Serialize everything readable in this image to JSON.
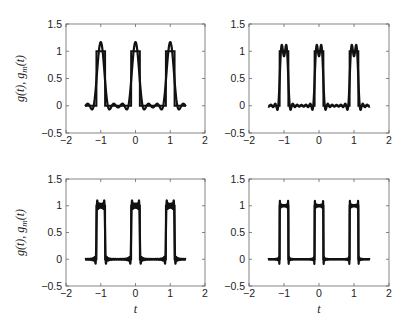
{
  "chart_data": [
    {
      "type": "line",
      "panel": "top-left",
      "title": "",
      "xlabel": "",
      "ylabel": "g(t), g_m(t)",
      "xlim": [
        -2,
        2
      ],
      "ylim": [
        -0.5,
        1.5
      ],
      "xticks": [
        -2,
        -1,
        0,
        1,
        2
      ],
      "yticks": [
        -0.5,
        0,
        0.5,
        1,
        1.5
      ],
      "xtick_labels": [
        "−2",
        "−1",
        "0",
        "1",
        "2"
      ],
      "ytick_labels": [
        "−0.5",
        "0",
        "0.5",
        "1",
        "1.5"
      ],
      "grid": false,
      "legend": null,
      "series": [
        {
          "name": "g(t)",
          "description": "periodic rectangular pulse train, period 1, pulse width 0.25 centered at integers, range t in [-1.5, 1.5]",
          "period": 1,
          "pulse_width": 0.25,
          "low": 0,
          "high": 1
        },
        {
          "name": "g_m(t)",
          "description": "Fourier partial sum approximation, few harmonics",
          "harmonics": 3
        }
      ]
    },
    {
      "type": "line",
      "panel": "top-right",
      "title": "",
      "xlabel": "",
      "ylabel": "",
      "xlim": [
        -2,
        2
      ],
      "ylim": [
        -0.5,
        1.5
      ],
      "xticks": [
        -2,
        -1,
        0,
        1,
        2
      ],
      "yticks": [
        -0.5,
        0,
        0.5,
        1,
        1.5
      ],
      "xtick_labels": [
        "−2",
        "−1",
        "0",
        "1",
        "2"
      ],
      "ytick_labels": [
        "−0.5",
        "0",
        "0.5",
        "1",
        "1.5"
      ],
      "grid": false,
      "legend": null,
      "series": [
        {
          "name": "g(t)",
          "period": 1,
          "pulse_width": 0.25,
          "low": 0,
          "high": 1
        },
        {
          "name": "g_m(t)",
          "description": "Fourier partial sum approximation, more harmonics",
          "harmonics": 7
        }
      ]
    },
    {
      "type": "line",
      "panel": "bottom-left",
      "title": "",
      "xlabel": "t",
      "ylabel": "g(t), g_m(t)",
      "xlim": [
        -2,
        2
      ],
      "ylim": [
        -0.5,
        1.5
      ],
      "xticks": [
        -2,
        -1,
        0,
        1,
        2
      ],
      "yticks": [
        -0.5,
        0,
        0.5,
        1,
        1.5
      ],
      "xtick_labels": [
        "−2",
        "−1",
        "0",
        "1",
        "2"
      ],
      "ytick_labels": [
        "−0.5",
        "0",
        "0.5",
        "1",
        "1.5"
      ],
      "grid": false,
      "legend": null,
      "series": [
        {
          "name": "g(t)",
          "period": 1,
          "pulse_width": 0.25,
          "low": 0,
          "high": 1
        },
        {
          "name": "g_m(t)",
          "description": "Fourier partial sum approximation, many harmonics (Gibbs overshoot ~1.09)",
          "harmonics": 20
        }
      ]
    },
    {
      "type": "line",
      "panel": "bottom-right",
      "title": "",
      "xlabel": "t",
      "ylabel": "",
      "xlim": [
        -2,
        2
      ],
      "ylim": [
        -0.5,
        1.5
      ],
      "xticks": [
        -2,
        -1,
        0,
        1,
        2
      ],
      "yticks": [
        -0.5,
        0,
        0.5,
        1,
        1.5
      ],
      "xtick_labels": [
        "−2",
        "−1",
        "0",
        "1",
        "2"
      ],
      "ytick_labels": [
        "−0.5",
        "0",
        "0.5",
        "1",
        "1.5"
      ],
      "grid": false,
      "legend": null,
      "series": [
        {
          "name": "g(t)",
          "period": 1,
          "pulse_width": 0.25,
          "low": 0,
          "high": 1
        },
        {
          "name": "g_m(t)",
          "description": "Fourier partial sum approximation, very many harmonics (Gibbs overshoot ~1.09)",
          "harmonics": 60
        }
      ]
    }
  ],
  "labels": {
    "ylabel_main": "g(t), g",
    "ylabel_sub": "m",
    "ylabel_tail": "(t)",
    "xlabel": "t"
  },
  "layout": {
    "panels": [
      {
        "left": 66,
        "top": 24,
        "right": 205,
        "bottom": 133,
        "show_ylabel": true,
        "show_xlabel": false
      },
      {
        "left": 249,
        "top": 24,
        "right": 389,
        "bottom": 133,
        "show_ylabel": false,
        "show_xlabel": false
      },
      {
        "left": 66,
        "top": 179,
        "right": 205,
        "bottom": 286,
        "show_ylabel": true,
        "show_xlabel": true
      },
      {
        "left": 249,
        "top": 179,
        "right": 389,
        "bottom": 286,
        "show_ylabel": false,
        "show_xlabel": true
      }
    ],
    "t_range": [
      -1.45,
      1.45
    ],
    "line_color": "#111111",
    "axes_color": "#666666"
  }
}
